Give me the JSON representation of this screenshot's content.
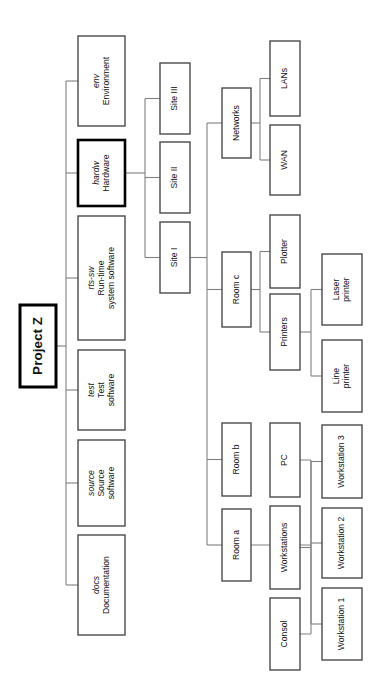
{
  "diagram": {
    "title": "Project Z",
    "type": "organizational-breakdown-tree",
    "orientation": "rotated-90-ccw",
    "root": {
      "id": "project-z",
      "label": "Project Z",
      "emphasis": "bold"
    },
    "nodes": [
      {
        "id": "docs",
        "code": "docs",
        "label": "Documentation",
        "lines": [
          "docs",
          "Documentation"
        ]
      },
      {
        "id": "source",
        "code": "source",
        "label": "Source software",
        "lines": [
          "source",
          "Source",
          "software"
        ]
      },
      {
        "id": "test",
        "code": "test",
        "label": "Test software",
        "lines": [
          "test",
          "Test",
          "software"
        ]
      },
      {
        "id": "rts-sw",
        "code": "rts-sw",
        "label": "Run-time system software",
        "lines": [
          "rts-sw",
          "Run-time",
          "system software"
        ]
      },
      {
        "id": "hardw",
        "code": "hardw",
        "label": "Hardware",
        "lines": [
          "hardw",
          "Hardware"
        ],
        "emphasis": "bold"
      },
      {
        "id": "env",
        "code": "env",
        "label": "Environment",
        "lines": [
          "env",
          "Environment"
        ]
      },
      {
        "id": "site-1",
        "label": "Site I",
        "lines": [
          "Site I"
        ]
      },
      {
        "id": "site-2",
        "label": "Site II",
        "lines": [
          "Site II"
        ]
      },
      {
        "id": "site-3",
        "label": "Site III",
        "lines": [
          "Site III"
        ]
      },
      {
        "id": "networks",
        "label": "Networks",
        "lines": [
          "Networks"
        ]
      },
      {
        "id": "lans",
        "label": "LANs",
        "lines": [
          "LANs"
        ]
      },
      {
        "id": "wan",
        "label": "WAN",
        "lines": [
          "WAN"
        ]
      },
      {
        "id": "room-c",
        "label": "Room c",
        "lines": [
          "Room c"
        ]
      },
      {
        "id": "room-b",
        "label": "Room b",
        "lines": [
          "Room b"
        ]
      },
      {
        "id": "room-a",
        "label": "Room a",
        "lines": [
          "Room a"
        ]
      },
      {
        "id": "plotter",
        "label": "Plotter",
        "lines": [
          "Plotter"
        ]
      },
      {
        "id": "printers",
        "label": "Printers",
        "lines": [
          "Printers"
        ]
      },
      {
        "id": "laser",
        "label": "Laser printer",
        "lines": [
          "Laser",
          "printer"
        ]
      },
      {
        "id": "line-pr",
        "label": "Line printer",
        "lines": [
          "Line",
          "printer"
        ]
      },
      {
        "id": "pc",
        "label": "PC",
        "lines": [
          "PC"
        ]
      },
      {
        "id": "workstations",
        "label": "Workstations",
        "lines": [
          "Workstations"
        ]
      },
      {
        "id": "consol",
        "label": "Consol",
        "lines": [
          "Consol"
        ]
      },
      {
        "id": "ws-1",
        "label": "Workstation 1",
        "lines": [
          "Workstation 1"
        ]
      },
      {
        "id": "ws-2",
        "label": "Workstation 2",
        "lines": [
          "Workstation 2"
        ]
      },
      {
        "id": "ws-3",
        "label": "Workstation 3",
        "lines": [
          "Workstation 3"
        ]
      }
    ],
    "edges": [
      {
        "from": "project-z",
        "to": "docs"
      },
      {
        "from": "project-z",
        "to": "source"
      },
      {
        "from": "project-z",
        "to": "test"
      },
      {
        "from": "project-z",
        "to": "rts-sw"
      },
      {
        "from": "project-z",
        "to": "hardw"
      },
      {
        "from": "project-z",
        "to": "env"
      },
      {
        "from": "hardw",
        "to": "site-1"
      },
      {
        "from": "hardw",
        "to": "site-2"
      },
      {
        "from": "hardw",
        "to": "site-3"
      },
      {
        "from": "site-1",
        "to": "networks"
      },
      {
        "from": "site-1",
        "to": "room-c"
      },
      {
        "from": "site-1",
        "to": "room-b"
      },
      {
        "from": "site-1",
        "to": "room-a"
      },
      {
        "from": "networks",
        "to": "lans"
      },
      {
        "from": "networks",
        "to": "wan"
      },
      {
        "from": "room-c",
        "to": "plotter"
      },
      {
        "from": "room-c",
        "to": "printers"
      },
      {
        "from": "printers",
        "to": "laser"
      },
      {
        "from": "printers",
        "to": "line-pr"
      },
      {
        "from": "room-a",
        "to": "pc"
      },
      {
        "from": "room-a",
        "to": "workstations"
      },
      {
        "from": "room-a",
        "to": "consol"
      },
      {
        "from": "workstations",
        "to": "ws-1"
      },
      {
        "from": "workstations",
        "to": "ws-2"
      },
      {
        "from": "workstations",
        "to": "ws-3"
      }
    ],
    "colors": {
      "background": "#ffffff",
      "box_stroke": "#4a4a4a",
      "box_stroke_bold": "#000000",
      "link_stroke": "#808080",
      "text": "#111111"
    }
  }
}
